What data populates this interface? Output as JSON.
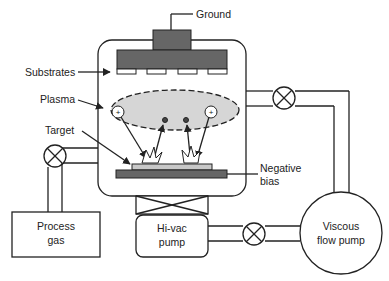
{
  "diagram": {
    "labels": {
      "ground": "Ground",
      "substrates": "Substrates",
      "plasma": "Plasma",
      "target": "Target",
      "negative_bias_line1": "Negative",
      "negative_bias_line2": "bias",
      "process_gas_line1": "Process",
      "process_gas_line2": "gas",
      "hivac_line1": "Hi-vac",
      "hivac_line2": "pump",
      "viscous_line1": "Viscous",
      "viscous_line2": "flow pump"
    },
    "ion_symbol": "+",
    "colors": {
      "line": "#222222",
      "electrode": "#666666",
      "plasma": "#d6d6d6",
      "target": "#c8c8c8",
      "background": "#ffffff"
    }
  }
}
